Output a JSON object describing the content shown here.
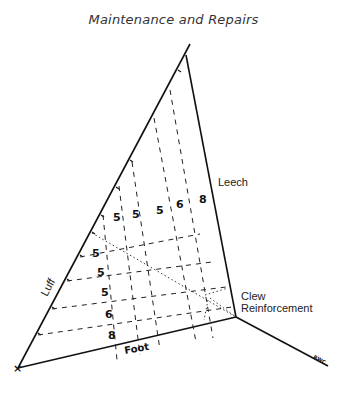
{
  "title": "Maintenance and Repairs",
  "labels": {
    "luff": "Luff",
    "leech": "Leech",
    "foot": "Foot",
    "clew_line1": "Clew",
    "clew_line2": "Reinforcement",
    "signature": "RWC"
  },
  "vertical_panel_numbers": [
    "5",
    "5",
    "5",
    "6",
    "8"
  ],
  "horizontal_panel_numbers": [
    "5",
    "5",
    "5",
    "6",
    "8"
  ],
  "tack_marker": "×"
}
